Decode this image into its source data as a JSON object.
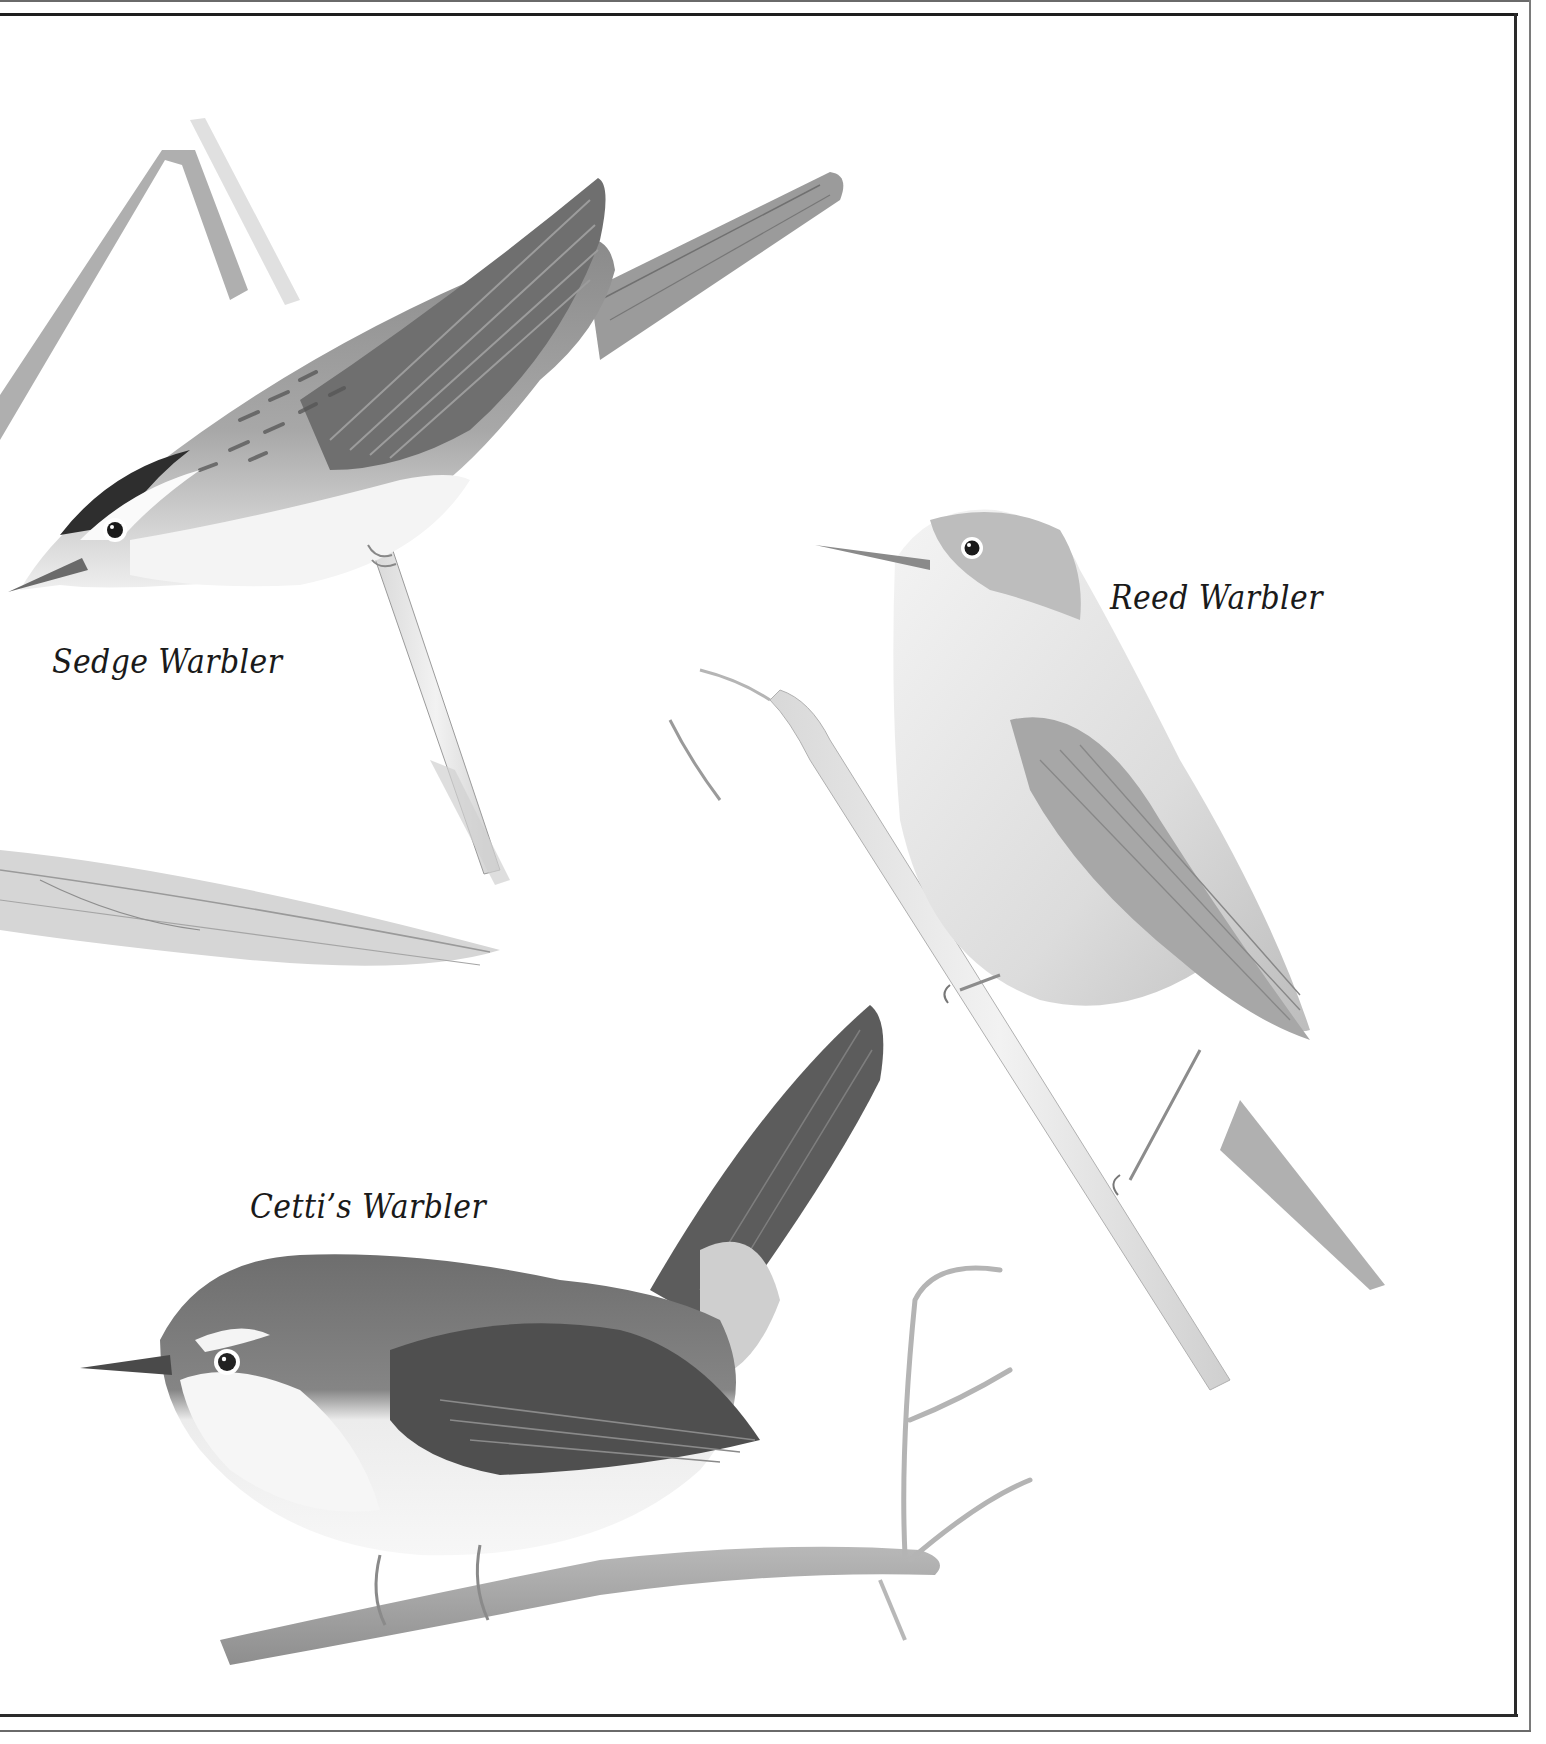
{
  "plate": {
    "description": "Illustrated plate of three warblers perched on reeds and a branch, grayscale",
    "colors": {
      "background": "#ffffff",
      "frame": "#2a2a2a",
      "label_text": "#1a1a1a"
    }
  },
  "labels": {
    "sedge": "Sedge Warbler",
    "reed": "Reed Warbler",
    "cetti": "Cetti’s Warbler"
  },
  "birds": [
    {
      "name": "Sedge Warbler",
      "perch": "reed stem",
      "position": "top-left"
    },
    {
      "name": "Reed Warbler",
      "perch": "reed stem",
      "position": "right"
    },
    {
      "name": "Cetti’s Warbler",
      "perch": "twiggy branch",
      "position": "bottom-left"
    }
  ]
}
